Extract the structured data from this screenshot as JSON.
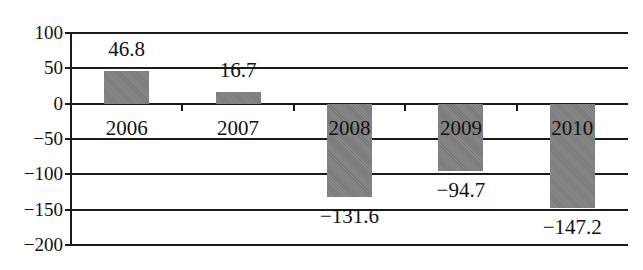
{
  "chart_data": {
    "type": "bar",
    "title": "",
    "xlabel": "",
    "ylabel": "",
    "categories": [
      "2006",
      "2007",
      "2008",
      "2009",
      "2010"
    ],
    "values": [
      46.8,
      16.7,
      -131.6,
      -94.7,
      -147.2
    ],
    "value_labels": [
      "46.8",
      "16.7",
      "−131.6",
      "−94.7",
      "−147.2"
    ],
    "ylim": [
      -200,
      100
    ],
    "yticks": [
      100,
      50,
      0,
      -50,
      -100,
      -150,
      -200
    ],
    "ytick_labels": [
      "100",
      "50",
      "0",
      "−50",
      "−100",
      "−150",
      "−200"
    ],
    "grid": true,
    "legend": null,
    "bar_color": "#7f7f7f"
  }
}
